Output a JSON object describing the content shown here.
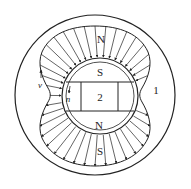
{
  "diagram": {
    "labels": {
      "stator_pole_top": "N",
      "rotor_pole_top": "S",
      "rotor_core": "2",
      "rotor_pole_bottom": "N",
      "stator_pole_bottom": "S",
      "stator": "1",
      "velocity": "v",
      "normal": "n"
    },
    "colors": {
      "line": "#222222",
      "background": "#ffffff"
    }
  }
}
